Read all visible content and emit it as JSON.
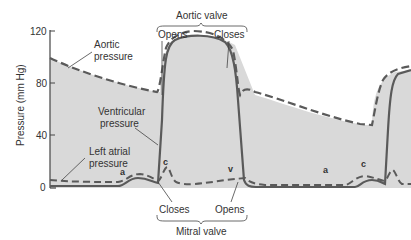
{
  "y_axis": {
    "label": "Pressure (mm Hg)",
    "ticks": [
      "0",
      "40",
      "80",
      "120"
    ]
  },
  "labels": {
    "aortic_pressure_line1": "Aortic",
    "aortic_pressure_line2": "pressure",
    "ventricular_pressure_line1": "Ventricular",
    "ventricular_pressure_line2": "pressure",
    "left_atrial_line1": "Left atrial",
    "left_atrial_line2": "pressure",
    "aortic_valve": "Aortic valve",
    "aortic_opens": "Opens",
    "aortic_closes": "Closes",
    "mitral_valve": "Mitral valve",
    "mitral_closes": "Closes",
    "mitral_opens": "Opens",
    "wave_a1": "a",
    "wave_c1": "c",
    "wave_v": "v",
    "wave_a2": "a",
    "wave_c2": "c"
  },
  "colors": {
    "fill": "#d9d9d9",
    "line": "#5a5a5a",
    "text": "#333333"
  }
}
